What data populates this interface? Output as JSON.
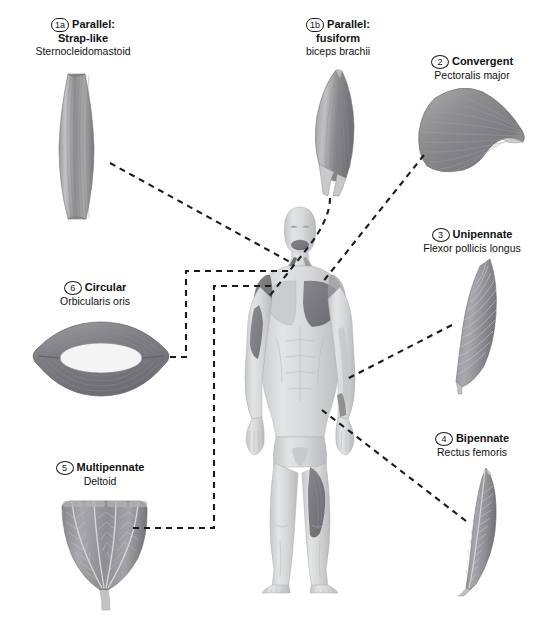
{
  "figure": {
    "background": "#ffffff",
    "muscle_fill_dark": "#6e6e70",
    "muscle_fill_mid": "#8c8c8e",
    "muscle_fill_light": "#b9b9bb",
    "body_fill": "#d8d9da",
    "highlight_fill": "#78797c",
    "leader_color": "#1b1b1b"
  },
  "labels": [
    {
      "id": "1a",
      "number": "1a",
      "title": "Parallel:",
      "title2": "Strap-like",
      "subtitle": "Sternocleidomastoid",
      "icon": "strap-like-muscle-icon"
    },
    {
      "id": "1b",
      "number": "1b",
      "title": "Parallel:",
      "title2": "fusiform",
      "subtitle": "biceps brachii",
      "icon": "fusiform-muscle-icon"
    },
    {
      "id": "2",
      "number": "2",
      "title": "Convergent",
      "title2": "",
      "subtitle": "Pectoralis major",
      "icon": "convergent-muscle-icon"
    },
    {
      "id": "3",
      "number": "3",
      "title": "Unipennate",
      "title2": "",
      "subtitle": "Flexor pollicis longus",
      "icon": "unipennate-muscle-icon"
    },
    {
      "id": "4",
      "number": "4",
      "title": "Bipennate",
      "title2": "",
      "subtitle": "Rectus femoris",
      "icon": "bipennate-muscle-icon"
    },
    {
      "id": "5",
      "number": "5",
      "title": "Multipennate",
      "title2": "",
      "subtitle": "Deltoid",
      "icon": "multipennate-muscle-icon"
    },
    {
      "id": "6",
      "number": "6",
      "title": "Circular",
      "title2": "",
      "subtitle": "Orbicularis oris",
      "icon": "circular-muscle-icon"
    }
  ],
  "body_figure": {
    "name": "human-anatomical-figure",
    "view": "anterior",
    "highlighted_regions": [
      "orbicularis-oris",
      "sternocleidomastoid",
      "deltoid",
      "pectoralis-major",
      "biceps-brachii",
      "rectus-femoris",
      "flexor-pollicis-longus"
    ]
  }
}
